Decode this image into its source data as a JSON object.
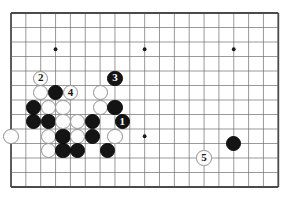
{
  "figure": {
    "board": {
      "line_color": "#6d6d6d",
      "edge_color": "#4a4a4a",
      "background_color": "#ffffff",
      "star_point_color": "#1a1a1a",
      "left": 11,
      "top": 13,
      "cell_w": 14.85,
      "cell_h": 14.5,
      "cols": 18,
      "rows": 12
    },
    "star_points": [
      {
        "col": 3,
        "row": 2.5
      },
      {
        "col": 9,
        "row": 2.5
      },
      {
        "col": 15,
        "row": 2.5
      },
      {
        "col": 9,
        "row": 8.5
      }
    ],
    "colors": {
      "black_stone": "#141414",
      "white_stone": "#fdfdfd",
      "white_stone_border": "#909090",
      "black_label_text": "#ffffff",
      "white_label_text": "#141414"
    },
    "stones": [
      {
        "name": "white-stone-move-2",
        "color": "white",
        "label": "2",
        "col": 2.0,
        "row": 4.5
      },
      {
        "name": "white-stone",
        "color": "white",
        "label": "",
        "col": 2.0,
        "row": 5.5
      },
      {
        "name": "black-stone",
        "color": "black",
        "label": "",
        "col": 3.0,
        "row": 5.5
      },
      {
        "name": "white-stone-move-4",
        "color": "white",
        "label": "4",
        "col": 4.0,
        "row": 5.5
      },
      {
        "name": "white-stone",
        "color": "white",
        "label": "",
        "col": 6.0,
        "row": 5.5
      },
      {
        "name": "black-stone-move-3",
        "color": "black",
        "label": "3",
        "col": 7.0,
        "row": 4.5
      },
      {
        "name": "black-stone",
        "color": "black",
        "label": "",
        "col": 1.5,
        "row": 6.5
      },
      {
        "name": "white-stone",
        "color": "white",
        "label": "",
        "col": 2.5,
        "row": 6.5
      },
      {
        "name": "white-stone",
        "color": "white",
        "label": "",
        "col": 3.5,
        "row": 6.5
      },
      {
        "name": "white-stone",
        "color": "white",
        "label": "",
        "col": 6.0,
        "row": 6.5
      },
      {
        "name": "black-stone",
        "color": "black",
        "label": "",
        "col": 7.0,
        "row": 6.5
      },
      {
        "name": "black-stone",
        "color": "black",
        "label": "",
        "col": 1.5,
        "row": 7.5
      },
      {
        "name": "black-stone",
        "color": "black",
        "label": "",
        "col": 2.5,
        "row": 7.5
      },
      {
        "name": "white-stone",
        "color": "white",
        "label": "",
        "col": 3.5,
        "row": 7.5
      },
      {
        "name": "white-stone",
        "color": "white",
        "label": "",
        "col": 4.5,
        "row": 7.5
      },
      {
        "name": "black-stone",
        "color": "black",
        "label": "",
        "col": 5.5,
        "row": 7.5
      },
      {
        "name": "black-stone-move-1",
        "color": "black",
        "label": "1",
        "col": 7.5,
        "row": 7.5
      },
      {
        "name": "white-stone",
        "color": "white",
        "label": "",
        "col": 0.0,
        "row": 8.5
      },
      {
        "name": "white-stone",
        "color": "white",
        "label": "",
        "col": 2.5,
        "row": 8.5
      },
      {
        "name": "black-stone",
        "color": "black",
        "label": "",
        "col": 3.5,
        "row": 8.5
      },
      {
        "name": "white-stone",
        "color": "white",
        "label": "",
        "col": 4.5,
        "row": 8.5
      },
      {
        "name": "black-stone",
        "color": "black",
        "label": "",
        "col": 5.5,
        "row": 8.5
      },
      {
        "name": "white-stone",
        "color": "white",
        "label": "",
        "col": 7.0,
        "row": 8.5
      },
      {
        "name": "white-stone",
        "color": "white",
        "label": "",
        "col": 2.5,
        "row": 9.5
      },
      {
        "name": "black-stone",
        "color": "black",
        "label": "",
        "col": 3.5,
        "row": 9.5
      },
      {
        "name": "black-stone",
        "color": "black",
        "label": "",
        "col": 4.5,
        "row": 9.5
      },
      {
        "name": "black-stone",
        "color": "black",
        "label": "",
        "col": 6.5,
        "row": 9.5
      },
      {
        "name": "white-stone-move-5",
        "color": "white",
        "label": "5",
        "col": 13.0,
        "row": 10.0
      },
      {
        "name": "black-stone",
        "color": "black",
        "label": "",
        "col": 15.0,
        "row": 9.0
      }
    ]
  }
}
